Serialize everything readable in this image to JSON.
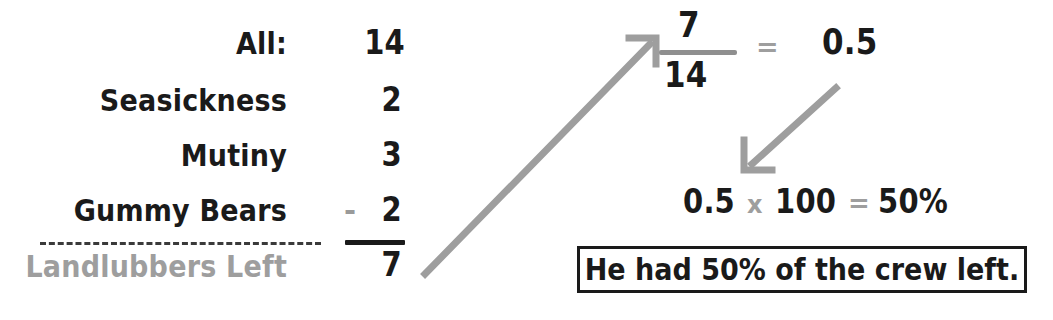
{
  "worksheet": {
    "title": "Crew subtraction and percent solution",
    "ink_color": "#1a1a1a",
    "accent_gray": "#9e9e9e"
  },
  "table": {
    "rows": [
      {
        "label": "All:",
        "value": "14",
        "operator": "",
        "label_color": "black"
      },
      {
        "label": "Seasickness",
        "value": "2",
        "operator": "",
        "label_color": "black"
      },
      {
        "label": "Mutiny",
        "value": "3",
        "operator": "",
        "label_color": "black"
      },
      {
        "label": "Gummy Bears",
        "value": "2",
        "operator": "-",
        "label_color": "black"
      },
      {
        "label": "Landlubbers Left",
        "value": "7",
        "operator": "",
        "label_color": "gray"
      }
    ]
  },
  "fraction": {
    "numerator": "7",
    "denominator": "14",
    "equals": "=",
    "result": "0.5"
  },
  "percent_line": {
    "decimal": "0.5",
    "times": "x",
    "hundred": "100",
    "equals": "=",
    "result": "50%"
  },
  "answer": {
    "text": "He had 50% of the crew left."
  },
  "arrows": [
    {
      "name": "arrow-total-to-fraction",
      "from": [
        425,
        274
      ],
      "to": [
        657,
        38
      ],
      "color": "#9e9e9e"
    },
    {
      "name": "arrow-decimal-to-percent",
      "from": [
        836,
        88
      ],
      "to": [
        744,
        172
      ],
      "color": "#9e9e9e"
    }
  ]
}
